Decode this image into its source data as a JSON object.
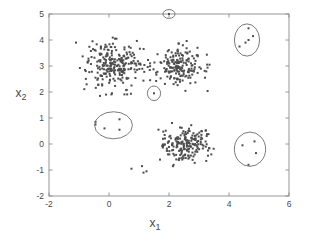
{
  "chart_data": {
    "type": "scatter",
    "title": "",
    "xlabel": "x_1",
    "ylabel": "x_2",
    "xlabel_base": "x",
    "xlabel_sub": "1",
    "ylabel_base": "x",
    "ylabel_sub": "2",
    "xlim": [
      -2,
      6
    ],
    "ylim": [
      -2,
      5
    ],
    "xticks": [
      -2,
      0,
      2,
      4,
      6
    ],
    "yticks": [
      -2,
      -1,
      0,
      1,
      2,
      3,
      4,
      5
    ],
    "xticklabels": [
      "-2",
      "0",
      "2",
      "4",
      "6"
    ],
    "yticklabels": [
      "-2",
      "-1",
      "0",
      "1",
      "2",
      "3",
      "4",
      "5"
    ],
    "grid": false,
    "legend": null,
    "point_color": "#4d4d4d",
    "point_size": 2.0,
    "marker": "square-dot",
    "axis_color": "#8c8c8c",
    "ellipse_color": "#6b6b6b",
    "clusters": [
      {
        "name": "cluster-upper-left",
        "center": [
          0.2,
          3.0
        ],
        "spread": [
          0.45,
          0.42
        ],
        "n": 240,
        "seed": 11
      },
      {
        "name": "cluster-upper-middle",
        "center": [
          2.35,
          3.0
        ],
        "spread": [
          0.36,
          0.37
        ],
        "n": 175,
        "seed": 29
      },
      {
        "name": "cluster-lower-middle",
        "center": [
          2.5,
          -0.05
        ],
        "spread": [
          0.38,
          0.33
        ],
        "n": 185,
        "seed": 47
      }
    ],
    "stray_points": [
      [
        -1.1,
        3.9
      ],
      [
        -0.8,
        2.85
      ],
      [
        -0.55,
        3.95
      ],
      [
        -0.45,
        2.55
      ],
      [
        -0.3,
        1.85
      ],
      [
        -0.25,
        3.45
      ],
      [
        -0.1,
        1.9
      ],
      [
        0.1,
        1.95
      ],
      [
        0.2,
        4.05
      ],
      [
        0.25,
        4.05
      ],
      [
        0.6,
        3.45
      ],
      [
        0.75,
        2.25
      ],
      [
        0.85,
        3.1
      ],
      [
        1.05,
        3.05
      ],
      [
        2.05,
        2.95
      ],
      [
        2.95,
        3.7
      ],
      [
        3.2,
        2.55
      ],
      [
        3.35,
        3.05
      ],
      [
        1.65,
        0.55
      ],
      [
        1.8,
        0.2
      ],
      [
        1.7,
        -0.6
      ],
      [
        3.3,
        -0.25
      ],
      [
        3.3,
        -0.45
      ],
      [
        0.75,
        -0.95
      ],
      [
        1.1,
        -0.85
      ],
      [
        1.15,
        -1.1
      ],
      [
        1.25,
        -1.05
      ],
      [
        -0.45,
        0.85
      ],
      [
        -0.45,
        0.75
      ]
    ],
    "outlier_groups": [
      {
        "name": "outlier-top-single",
        "shape": "circle",
        "center": [
          2.0,
          5.0
        ],
        "rx": 0.2,
        "ry": 0.17,
        "points": [
          [
            2.0,
            5.0
          ]
        ]
      },
      {
        "name": "outlier-mid-single",
        "shape": "ellipse",
        "center": [
          1.5,
          1.95
        ],
        "rx": 0.22,
        "ry": 0.28,
        "points": [
          [
            1.5,
            1.95
          ]
        ]
      },
      {
        "name": "outlier-top-right",
        "shape": "ellipse",
        "center": [
          4.6,
          4.0
        ],
        "rx": 0.42,
        "ry": 0.62,
        "points": [
          [
            4.65,
            4.45
          ],
          [
            4.8,
            4.15
          ],
          [
            4.65,
            4.0
          ],
          [
            4.55,
            3.9
          ],
          [
            4.35,
            3.75
          ]
        ]
      },
      {
        "name": "outlier-left-ellipse",
        "shape": "ellipse",
        "center": [
          0.15,
          0.72
        ],
        "rx": 0.63,
        "ry": 0.52,
        "points": [
          [
            0.35,
            0.95
          ],
          [
            0.35,
            0.55
          ],
          [
            -0.15,
            0.6
          ]
        ]
      },
      {
        "name": "outlier-bottom-right",
        "shape": "circle",
        "center": [
          4.7,
          -0.2
        ],
        "rx": 0.52,
        "ry": 0.66,
        "points": [
          [
            4.45,
            -0.05
          ],
          [
            4.85,
            0.1
          ],
          [
            4.9,
            -0.35
          ],
          [
            4.65,
            -0.8
          ]
        ]
      }
    ]
  }
}
